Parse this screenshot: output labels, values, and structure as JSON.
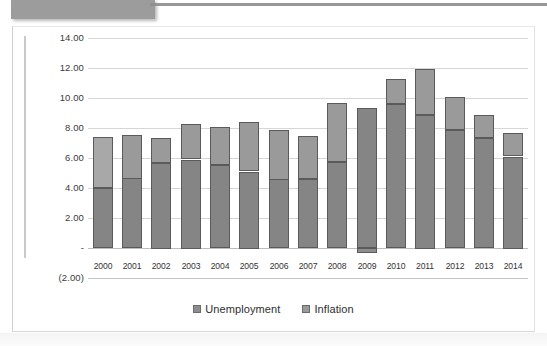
{
  "chart_data": {
    "type": "bar",
    "subtype": "stacked-bar",
    "title": "",
    "xlabel": "",
    "ylabel": "",
    "categories": [
      "2000",
      "2001",
      "2002",
      "2003",
      "2004",
      "2005",
      "2006",
      "2007",
      "2008",
      "2009",
      "2010",
      "2011",
      "2012",
      "2013",
      "2014"
    ],
    "series": [
      {
        "name": "Unemployment",
        "color": "#858585",
        "values": [
          4.0,
          4.65,
          5.7,
          5.9,
          5.55,
          5.1,
          4.6,
          4.6,
          5.75,
          9.3,
          9.6,
          8.9,
          7.85,
          7.35,
          6.1
        ]
      },
      {
        "name": "Inflation",
        "color": "#9a9a9a",
        "values": [
          3.4,
          2.9,
          1.65,
          2.35,
          2.55,
          3.3,
          3.3,
          2.85,
          3.9,
          -0.35,
          1.7,
          3.05,
          2.2,
          1.5,
          1.55
        ]
      }
    ],
    "totals": [
      7.4,
      7.55,
      7.35,
      8.25,
      8.1,
      8.4,
      7.9,
      7.45,
      9.65,
      9.3,
      11.3,
      11.95,
      10.05,
      8.85,
      7.65
    ],
    "ylim": [
      -2.0,
      14.0
    ],
    "ytick_values": [
      14.0,
      12.0,
      10.0,
      8.0,
      6.0,
      4.0,
      2.0,
      0.0,
      -2.0
    ],
    "ytick_labels": [
      "14.00",
      "12.00",
      "10.00",
      "8.00",
      "6.00",
      "4.00",
      "2.00",
      "-",
      "(2.00)"
    ],
    "grid": true,
    "legend_position": "bottom"
  },
  "legend": {
    "items": [
      {
        "label": "Unemployment",
        "swatch": "unemployment-swatch",
        "color": "#8d8d8d"
      },
      {
        "label": "Inflation",
        "swatch": "inflation-swatch",
        "color": "#9a9a9a"
      }
    ]
  },
  "colors": {
    "unemployment": "#858585",
    "inflation": "#9a9a9a",
    "bar_outline": "#5a5a5a",
    "gridline": "#d6d6d6",
    "banner": "#9c9c9c"
  }
}
